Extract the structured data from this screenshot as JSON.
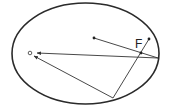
{
  "diagram": {
    "type": "geometry",
    "title": "",
    "ellipse": {
      "cx": 85.5,
      "cy": 53.5,
      "rx": 73.5,
      "ry": 50.5,
      "stroke": "#2a2a2a",
      "stroke_width": 1.6
    },
    "labels": [
      {
        "id": "F",
        "text": "F",
        "x": 135,
        "y": 48
      }
    ],
    "points": [
      {
        "id": "O",
        "x": 30,
        "y": 53,
        "style": "open-circle"
      },
      {
        "id": "inner",
        "x": 94,
        "y": 38,
        "style": "dot"
      },
      {
        "id": "upper-right",
        "x": 149,
        "y": 39,
        "style": "dot"
      },
      {
        "id": "F",
        "x": 141,
        "y": 53,
        "style": "dot"
      },
      {
        "id": "right-vertex",
        "x": 158,
        "y": 58,
        "style": "none"
      },
      {
        "id": "bottom",
        "x": 113,
        "y": 98,
        "style": "none"
      }
    ],
    "segments": [
      {
        "from": [
          94,
          38
        ],
        "to": [
          158,
          58
        ]
      },
      {
        "from": [
          158,
          58
        ],
        "to": [
          37,
          53
        ],
        "arrow_end": true
      },
      {
        "from": [
          113,
          98
        ],
        "to": [
          34,
          56
        ],
        "arrow_end": true
      },
      {
        "from": [
          113,
          98
        ],
        "to": [
          149,
          39
        ]
      }
    ],
    "line_color": "#333333"
  }
}
